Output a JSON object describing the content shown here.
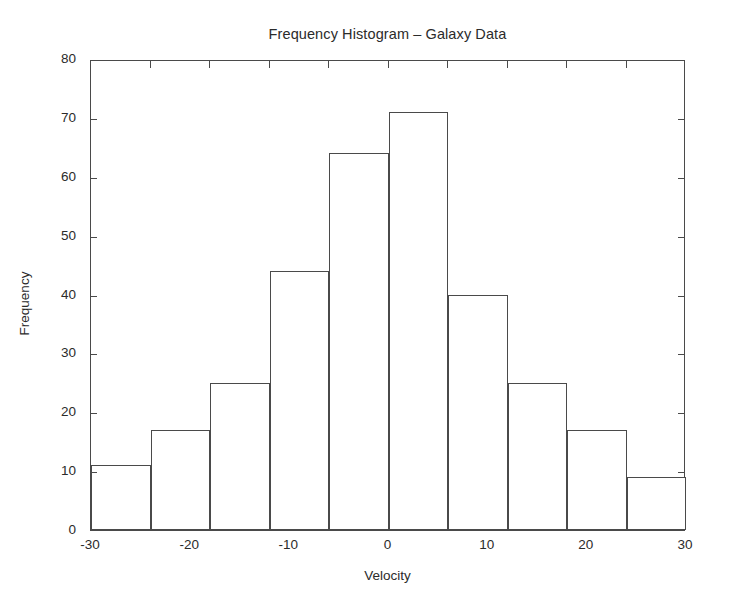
{
  "chart_data": {
    "type": "bar",
    "title": "Frequency Histogram – Galaxy Data",
    "xlabel": "Velocity",
    "ylabel": "Frequency",
    "xlim": [
      -30,
      30
    ],
    "ylim": [
      0,
      80
    ],
    "grid": false,
    "legend": null,
    "bin_width": 6,
    "bin_edges": [
      -30,
      -24,
      -18,
      -12,
      -6,
      0,
      6,
      12,
      18,
      24,
      30
    ],
    "bin_centers": [
      -27,
      -21,
      -15,
      -9,
      -3,
      3,
      9,
      15,
      21,
      27
    ],
    "categories": [
      "-30 to -24",
      "-24 to -18",
      "-18 to -12",
      "-12 to -6",
      "-6 to 0",
      "0 to 6",
      "6 to 12",
      "12 to 18",
      "18 to 24",
      "24 to 30"
    ],
    "values": [
      11,
      17,
      25,
      44,
      64,
      71,
      40,
      25,
      17,
      9
    ],
    "xticks": [
      -30,
      -20,
      -10,
      0,
      10,
      20,
      30
    ],
    "xtick_labels": [
      "-30",
      "-20",
      "-10",
      "0",
      "10",
      "20",
      "30"
    ],
    "yticks": [
      0,
      10,
      20,
      30,
      40,
      50,
      60,
      70,
      80
    ],
    "ytick_labels": [
      "0",
      "10",
      "20",
      "30",
      "40",
      "50",
      "60",
      "70",
      "80"
    ],
    "bar_fill_color": "#ffffff",
    "bar_edge_color": "#4a4a4a",
    "axis_color": "#4a4a4a",
    "background_color": "#ffffff"
  }
}
